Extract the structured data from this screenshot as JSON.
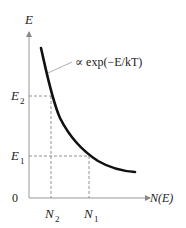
{
  "diagram": {
    "y_axis_label": "E",
    "x_axis_label": "N(E)",
    "origin_label": "0",
    "curve_label": "∝ exp(−E/kT)",
    "y_ticks": [
      {
        "name": "E",
        "sub": "2",
        "y": 96
      },
      {
        "name": "E",
        "sub": "1",
        "y": 156
      }
    ],
    "x_ticks": [
      {
        "name": "N",
        "sub": "2",
        "x": 50
      },
      {
        "name": "N",
        "sub": "1",
        "x": 89
      }
    ],
    "colors": {
      "axis": "#999999",
      "curve": "#111111",
      "dashed": "#777777",
      "text": "#222222"
    }
  }
}
